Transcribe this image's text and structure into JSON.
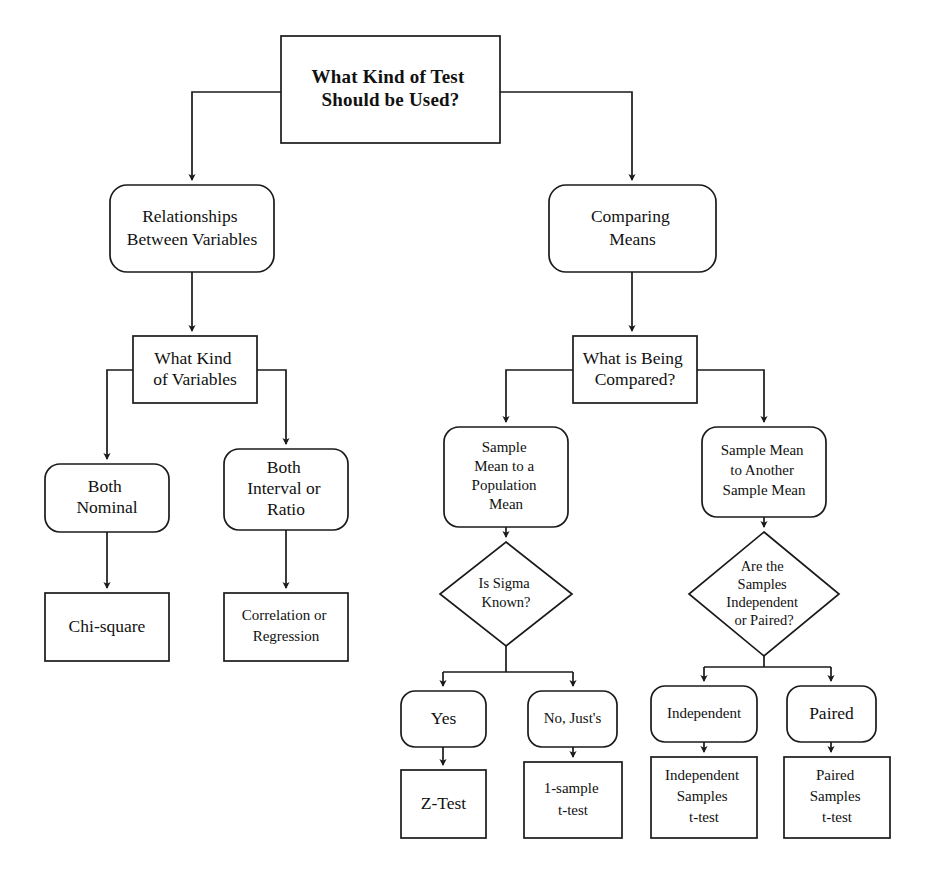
{
  "diagram": {
    "kind": "flowchart",
    "orientation": "top-down",
    "background_color": "#ffffff",
    "line_color": "#1a1a1a",
    "text_color": "#111111",
    "root_question": "What Kind of Test Should be Used?"
  },
  "nodes": {
    "root": {
      "id": "root",
      "shape": "rectangle",
      "text": "What Kind of Test\nShould be Used?",
      "line1": "What Kind of Test",
      "line2": "Should be Used?",
      "x": 281,
      "y": 36,
      "w": 219,
      "h": 107
    },
    "relationships": {
      "id": "relationships",
      "shape": "rounded-rectangle",
      "text": "Relationships\nBetween Variables",
      "line1": "Relationships",
      "line2": "Between Variables",
      "x": 110,
      "y": 185,
      "w": 164,
      "h": 87
    },
    "comparing_means": {
      "id": "comparing_means",
      "shape": "rounded-rectangle",
      "text": "Comparing\nMeans",
      "line1": "Comparing",
      "line2": "Means",
      "x": 549,
      "y": 185,
      "w": 167,
      "h": 87
    },
    "what_kind_variables": {
      "id": "what_kind_variables",
      "shape": "rectangle",
      "text": "What Kind\nof Variables",
      "line1": "What Kind",
      "line2": "of Variables",
      "x": 133,
      "y": 336,
      "w": 124,
      "h": 67
    },
    "what_is_compared": {
      "id": "what_is_compared",
      "shape": "rectangle",
      "text": "What is Being\nCompared?",
      "line1": "What is Being",
      "line2": "Compared?",
      "x": 573,
      "y": 336,
      "w": 124,
      "h": 67
    },
    "both_nominal": {
      "id": "both_nominal",
      "shape": "rounded-rectangle",
      "text": "Both\nNominal",
      "line1": "Both",
      "line2": "Nominal",
      "x": 45,
      "y": 464,
      "w": 124,
      "h": 68
    },
    "both_interval_ratio": {
      "id": "both_interval_ratio",
      "shape": "rounded-rectangle",
      "text": "Both\nInterval or\nRatio",
      "line1": "Both",
      "line2": "Interval or",
      "line3": "Ratio",
      "x": 224,
      "y": 449,
      "w": 124,
      "h": 81
    },
    "sample_to_population": {
      "id": "sample_to_population",
      "shape": "rounded-rectangle",
      "text": "Sample\nMean to a\nPopulation\nMean",
      "line1": "Sample",
      "line2": "Mean to a",
      "line3": "Population",
      "line4": "Mean",
      "x": 444,
      "y": 427,
      "w": 124,
      "h": 100
    },
    "sample_to_sample": {
      "id": "sample_to_sample",
      "shape": "rounded-rectangle",
      "text": "Sample Mean\nto Another\nSample Mean",
      "line1": "Sample Mean",
      "line2": "to Another",
      "line3": "Sample Mean",
      "x": 702,
      "y": 427,
      "w": 124,
      "h": 90
    },
    "chi_square": {
      "id": "chi_square",
      "shape": "rectangle",
      "text": "Chi-square",
      "line1": "Chi-square",
      "x": 45,
      "y": 593,
      "w": 124,
      "h": 68
    },
    "correlation_regression": {
      "id": "correlation_regression",
      "shape": "rectangle",
      "text": "Correlation or\nRegression",
      "line1": "Correlation or",
      "line2": "Regression",
      "x": 224,
      "y": 593,
      "w": 124,
      "h": 68
    },
    "is_sigma_known": {
      "id": "is_sigma_known",
      "shape": "diamond",
      "text": "Is Sigma\nKnown?",
      "line1": "Is Sigma",
      "line2": "Known?",
      "cx": 506,
      "cy": 594,
      "rx": 66,
      "ry": 52
    },
    "are_samples_independent": {
      "id": "are_samples_independent",
      "shape": "diamond",
      "text": "Are the\nSamples\nIndependent\nor Paired?",
      "line1": "Are the",
      "line2": "Samples",
      "line3": "Independent",
      "line4": "or Paired?",
      "cx": 764,
      "cy": 594,
      "rx": 75,
      "ry": 62
    },
    "yes": {
      "id": "yes",
      "shape": "rounded-rectangle",
      "text": "Yes",
      "line1": "Yes",
      "x": 401,
      "y": 691,
      "w": 85,
      "h": 56
    },
    "no_justs": {
      "id": "no_justs",
      "shape": "rounded-rectangle",
      "text": "No, Just's",
      "line1": "No, Just's",
      "x": 528,
      "y": 691,
      "w": 89,
      "h": 56
    },
    "independent": {
      "id": "independent",
      "shape": "rounded-rectangle",
      "text": "Independent",
      "line1": "Independent",
      "x": 651,
      "y": 686,
      "w": 106,
      "h": 56
    },
    "paired": {
      "id": "paired",
      "shape": "rounded-rectangle",
      "text": "Paired",
      "line1": "Paired",
      "x": 787,
      "y": 686,
      "w": 89,
      "h": 56
    },
    "z_test": {
      "id": "z_test",
      "shape": "rectangle",
      "text": "Z-Test",
      "line1": "Z-Test",
      "x": 401,
      "y": 770,
      "w": 85,
      "h": 68
    },
    "one_sample_t": {
      "id": "one_sample_t",
      "shape": "rectangle",
      "text": "1-sample\nt-test",
      "line1": "1-sample",
      "line2": "t-test",
      "x": 524,
      "y": 762,
      "w": 98,
      "h": 76
    },
    "independent_samples_t": {
      "id": "independent_samples_t",
      "shape": "rectangle",
      "text": "Independent\nSamples\nt-test",
      "line1": "Independent",
      "line2": "Samples",
      "line3": "t-test",
      "x": 651,
      "y": 757,
      "w": 106,
      "h": 81
    },
    "paired_samples_t": {
      "id": "paired_samples_t",
      "shape": "rectangle",
      "text": "Paired\nSamples\nt-test",
      "line1": "Paired",
      "line2": "Samples",
      "line3": "t-test",
      "x": 784,
      "y": 757,
      "w": 106,
      "h": 81
    }
  },
  "edges": [
    {
      "from": "root",
      "to": "relationships",
      "style": "elbow-left"
    },
    {
      "from": "root",
      "to": "comparing_means",
      "style": "elbow-right"
    },
    {
      "from": "relationships",
      "to": "what_kind_variables",
      "style": "straight"
    },
    {
      "from": "comparing_means",
      "to": "what_is_compared",
      "style": "straight"
    },
    {
      "from": "what_kind_variables",
      "to": "both_nominal",
      "style": "elbow-left"
    },
    {
      "from": "what_kind_variables",
      "to": "both_interval_ratio",
      "style": "elbow-right"
    },
    {
      "from": "both_nominal",
      "to": "chi_square",
      "style": "straight"
    },
    {
      "from": "both_interval_ratio",
      "to": "correlation_regression",
      "style": "straight"
    },
    {
      "from": "what_is_compared",
      "to": "sample_to_population",
      "style": "elbow-left"
    },
    {
      "from": "what_is_compared",
      "to": "sample_to_sample",
      "style": "elbow-right"
    },
    {
      "from": "sample_to_population",
      "to": "is_sigma_known",
      "style": "straight"
    },
    {
      "from": "sample_to_sample",
      "to": "are_samples_independent",
      "style": "straight"
    },
    {
      "from": "is_sigma_known",
      "to": "yes",
      "style": "split-left"
    },
    {
      "from": "is_sigma_known",
      "to": "no_justs",
      "style": "split-right"
    },
    {
      "from": "are_samples_independent",
      "to": "independent",
      "style": "split-left"
    },
    {
      "from": "are_samples_independent",
      "to": "paired",
      "style": "split-right"
    },
    {
      "from": "yes",
      "to": "z_test",
      "style": "straight"
    },
    {
      "from": "no_justs",
      "to": "one_sample_t",
      "style": "straight"
    },
    {
      "from": "independent",
      "to": "independent_samples_t",
      "style": "straight"
    },
    {
      "from": "paired",
      "to": "paired_samples_t",
      "style": "straight"
    }
  ]
}
